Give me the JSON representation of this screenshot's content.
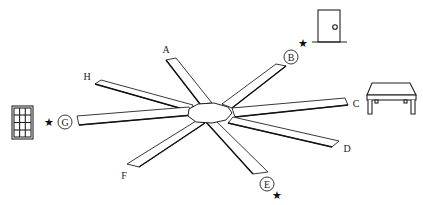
{
  "diagram": {
    "type": "radial-arm-maze",
    "arms": [
      {
        "id": "A",
        "label": "A",
        "circled": false,
        "starred": false
      },
      {
        "id": "B",
        "label": "B",
        "circled": true,
        "starred": true
      },
      {
        "id": "C",
        "label": "C",
        "circled": false,
        "starred": false
      },
      {
        "id": "D",
        "label": "D",
        "circled": false,
        "starred": false
      },
      {
        "id": "E",
        "label": "E",
        "circled": true,
        "starred": true
      },
      {
        "id": "F",
        "label": "F",
        "circled": false,
        "starred": false
      },
      {
        "id": "G",
        "label": "G",
        "circled": true,
        "starred": true
      },
      {
        "id": "H",
        "label": "H",
        "circled": false,
        "starred": false
      }
    ],
    "star_glyph": "★",
    "landmarks": [
      {
        "name": "door",
        "near_arm": "B"
      },
      {
        "name": "table",
        "near_arm": "C"
      },
      {
        "name": "window",
        "near_arm": "G"
      }
    ],
    "colors": {
      "line": "#222222",
      "background": "#ffffff"
    }
  }
}
